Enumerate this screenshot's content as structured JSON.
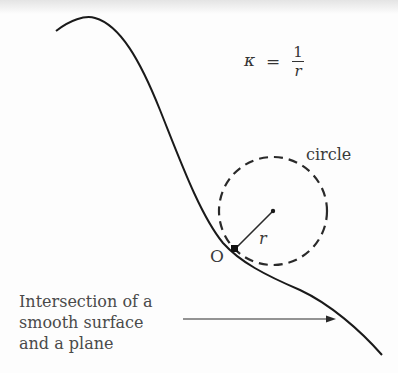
{
  "diagram": {
    "formula": {
      "lhs": "κ",
      "equals": "=",
      "numerator": "1",
      "denominator": "r"
    },
    "circle_label": "circle",
    "radius_label": "r",
    "origin_label": "O",
    "caption_lines": [
      "Intersection of a",
      "smooth surface",
      "and a plane"
    ],
    "colors": {
      "curve": "#1a1a1a",
      "circle": "#2a2a2a",
      "text": "#3a3a3a"
    }
  }
}
